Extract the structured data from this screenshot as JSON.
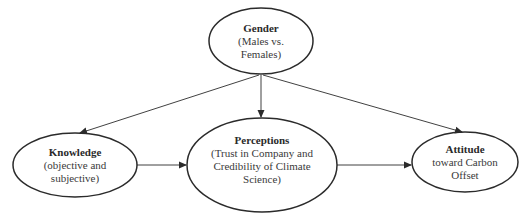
{
  "diagram": {
    "type": "path-model",
    "colors": {
      "stroke": "#2b2b2b",
      "text": "#333333",
      "background": "#ffffff"
    },
    "nodes": {
      "gender": {
        "title": "Gender",
        "line1": "(Males vs.",
        "line2": "Females)",
        "line3": ""
      },
      "knowledge": {
        "title": "Knowledge",
        "line1": "(objective and",
        "line2": "subjective)",
        "line3": ""
      },
      "perceptions": {
        "title": "Perceptions",
        "line1": "(Trust in Company and",
        "line2": "Credibility of Climate",
        "line3": "Science)"
      },
      "attitude": {
        "title": "Attitude",
        "line1": "toward Carbon",
        "line2": "Offset",
        "line3": ""
      }
    },
    "edges": [
      {
        "from": "gender",
        "to": "knowledge"
      },
      {
        "from": "gender",
        "to": "perceptions"
      },
      {
        "from": "gender",
        "to": "attitude"
      },
      {
        "from": "knowledge",
        "to": "perceptions"
      },
      {
        "from": "perceptions",
        "to": "attitude"
      }
    ]
  }
}
